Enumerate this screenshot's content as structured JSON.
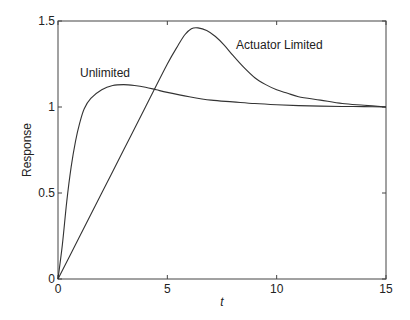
{
  "chart_data": {
    "type": "line",
    "title": "",
    "xlabel": "t",
    "ylabel": "Response",
    "xlim": [
      0,
      15
    ],
    "ylim": [
      0,
      1.5
    ],
    "xticks": [
      0,
      5,
      10,
      15
    ],
    "xtick_labels": [
      "0",
      "5",
      "10",
      "15"
    ],
    "yticks": [
      0,
      0.5,
      1,
      1.5
    ],
    "ytick_labels": [
      "0",
      "0.5",
      "1",
      "1.5"
    ],
    "grid": false,
    "legend": null,
    "series": [
      {
        "name": "Unlimited",
        "color": "#333333",
        "x": [
          0,
          0.2,
          0.4,
          0.6,
          0.8,
          1.0,
          1.2,
          1.5,
          2.0,
          2.5,
          3.0,
          3.5,
          4.0,
          4.5,
          5.0,
          6.0,
          7.0,
          8.0,
          9.0,
          10.0,
          11.0,
          12.0,
          13.0,
          14.0,
          15.0
        ],
        "y": [
          0,
          0.2,
          0.45,
          0.65,
          0.8,
          0.91,
          0.99,
          1.05,
          1.1,
          1.125,
          1.13,
          1.125,
          1.115,
          1.1,
          1.085,
          1.06,
          1.04,
          1.03,
          1.02,
          1.013,
          1.008,
          1.005,
          1.003,
          1.002,
          1.0
        ]
      },
      {
        "name": "Actuator Limited",
        "color": "#333333",
        "x": [
          0,
          1,
          2,
          3,
          4,
          5,
          5.5,
          5.8,
          6.1,
          6.4,
          6.8,
          7.2,
          7.6,
          8.0,
          8.5,
          9.0,
          9.5,
          10.0,
          10.5,
          11.0,
          12.0,
          13.0,
          14.0,
          15.0
        ],
        "y": [
          0,
          0.25,
          0.5,
          0.75,
          1.0,
          1.25,
          1.36,
          1.42,
          1.455,
          1.46,
          1.445,
          1.41,
          1.36,
          1.3,
          1.23,
          1.17,
          1.13,
          1.1,
          1.08,
          1.06,
          1.04,
          1.02,
          1.01,
          1.0
        ]
      }
    ],
    "annotations": [
      {
        "text": "Unlimited",
        "x": 1.0,
        "y": 1.17
      },
      {
        "text": "Actuator Limited",
        "x": 8.1,
        "y": 1.34
      }
    ]
  },
  "labels": {
    "xlabel": "t",
    "ylabel": "Response",
    "annot_unlimited": "Unlimited",
    "annot_actuator": "Actuator Limited"
  }
}
